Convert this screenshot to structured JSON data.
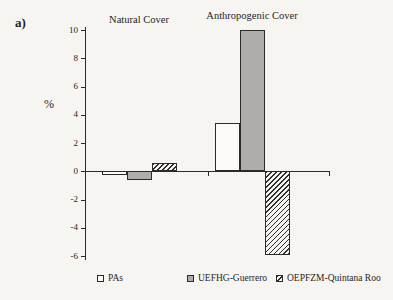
{
  "figure": {
    "panel_label": "a)",
    "y_axis_title": "%"
  },
  "chart_data": {
    "type": "bar",
    "categories": [
      "Natural Cover",
      "Anthropogenic Cover"
    ],
    "series": [
      {
        "name": "PAs",
        "fill": "white",
        "values": [
          -0.3,
          3.4
        ]
      },
      {
        "name": "UEFHG-Guerrero",
        "fill": "gray",
        "values": [
          -0.6,
          10.0
        ]
      },
      {
        "name": "OEPFZM-Quintana Roo",
        "fill": "hatch",
        "values": [
          0.6,
          -5.9
        ]
      }
    ],
    "ylabel": "%",
    "ylim": [
      -6,
      10
    ],
    "yticks": [
      10,
      8,
      6,
      4,
      2,
      0,
      -2,
      -4,
      -6
    ],
    "grid": false,
    "legend_position": "bottom"
  },
  "colors": {
    "background": "#f6f5f1",
    "axis_line": "#2a2a2a",
    "bar_white": "#fbfaf7",
    "bar_gray": "#aeadaa",
    "hatch_stroke": "#2e2e2e"
  }
}
